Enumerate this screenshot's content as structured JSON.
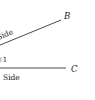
{
  "diagram": {
    "title": "",
    "points": [
      {
        "name": "B",
        "x": 68,
        "y": 16
      },
      {
        "name": "C",
        "x": 75,
        "y": 71
      }
    ],
    "rays": [
      {
        "name": "ray-to-B",
        "label": "Side",
        "from": [
          -12,
          50
        ],
        "to": [
          61,
          20
        ]
      },
      {
        "name": "ray-to-C",
        "label": "Side",
        "from": [
          -12,
          68
        ],
        "to": [
          66,
          68
        ]
      }
    ],
    "angle_label": "∠1",
    "colors": {
      "line": "#333333",
      "text": "#222222",
      "background": "#ffffff"
    }
  },
  "labels": {
    "point_b": "B",
    "point_c": "C",
    "side_upper": "Side",
    "side_lower": "Side",
    "angle": "∠1"
  }
}
